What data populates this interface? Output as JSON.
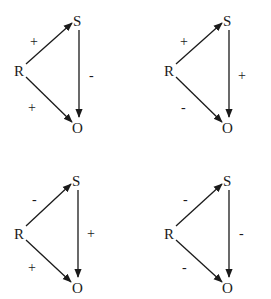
{
  "diagrams": [
    {
      "id": "top-left",
      "nodes": {
        "R": "R",
        "S": "S",
        "O": "O"
      },
      "edges": [
        {
          "from": "R",
          "to": "S",
          "sign": "+"
        },
        {
          "from": "S",
          "to": "O",
          "sign": "-"
        },
        {
          "from": "R",
          "to": "O",
          "sign": "+"
        }
      ]
    },
    {
      "id": "top-right",
      "nodes": {
        "R": "R",
        "S": "S",
        "O": "O"
      },
      "edges": [
        {
          "from": "R",
          "to": "S",
          "sign": "+"
        },
        {
          "from": "S",
          "to": "O",
          "sign": "+"
        },
        {
          "from": "R",
          "to": "O",
          "sign": "-"
        }
      ]
    },
    {
      "id": "bottom-left",
      "nodes": {
        "R": "R",
        "S": "S",
        "O": "O"
      },
      "edges": [
        {
          "from": "R",
          "to": "S",
          "sign": "-"
        },
        {
          "from": "S",
          "to": "O",
          "sign": "+"
        },
        {
          "from": "R",
          "to": "O",
          "sign": "+"
        }
      ]
    },
    {
      "id": "bottom-right",
      "nodes": {
        "R": "R",
        "S": "S",
        "O": "O"
      },
      "edges": [
        {
          "from": "R",
          "to": "S",
          "sign": "-"
        },
        {
          "from": "S",
          "to": "O",
          "sign": "-"
        },
        {
          "from": "R",
          "to": "O",
          "sign": "-"
        }
      ]
    }
  ]
}
